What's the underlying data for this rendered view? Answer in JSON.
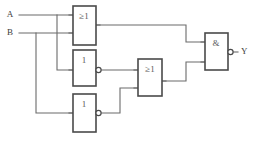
{
  "diagram": {
    "type": "logic-gate-schematic",
    "canvas": {
      "width": 257,
      "height": 141
    },
    "colors": {
      "background": "#ffffff",
      "wire": "#6b6b6b",
      "gate_outline": "#4a4a4a",
      "label_text": "#3d3d3d",
      "gate_label_text": "#5a5a5a"
    }
  },
  "inputs": [
    {
      "id": "A",
      "label": "A",
      "x": 10,
      "y": 15
    },
    {
      "id": "B",
      "label": "B",
      "x": 10,
      "y": 33
    }
  ],
  "outputs": [
    {
      "id": "Y",
      "label": "Y",
      "x": 241,
      "y": 52
    }
  ],
  "gates": [
    {
      "id": "or1",
      "label": "≥1",
      "type": "OR",
      "inverted_output": false,
      "x": 73,
      "y": 6,
      "w": 23,
      "h": 39,
      "label_x": 84,
      "label_y": 17,
      "inputs": [
        {
          "name": "in-a",
          "y": 15
        },
        {
          "name": "in-b",
          "y": 33
        }
      ],
      "output_y": 25
    },
    {
      "id": "inv1",
      "label": "1",
      "type": "NOT",
      "inverted_output": true,
      "x": 73,
      "y": 50,
      "w": 23,
      "h": 36,
      "label_x": 84,
      "label_y": 61,
      "inputs": [
        {
          "name": "in-a",
          "y": 70
        }
      ],
      "output_y": 70,
      "bubble_cx": 98.5,
      "bubble_cy": 70,
      "bubble_r": 2.6
    },
    {
      "id": "inv2",
      "label": "1",
      "type": "NOT",
      "inverted_output": true,
      "x": 73,
      "y": 94,
      "w": 23,
      "h": 38,
      "label_x": 84,
      "label_y": 105,
      "inputs": [
        {
          "name": "in-a",
          "y": 113
        }
      ],
      "output_y": 113,
      "bubble_cx": 98.5,
      "bubble_cy": 113,
      "bubble_r": 2.6
    },
    {
      "id": "or2",
      "label": "≥1",
      "type": "OR",
      "inverted_output": false,
      "x": 138,
      "y": 59,
      "w": 24,
      "h": 37,
      "label_x": 150,
      "label_y": 70,
      "inputs": [
        {
          "name": "in-a",
          "y": 70
        },
        {
          "name": "in-b",
          "y": 88
        }
      ],
      "output_y": 81
    },
    {
      "id": "and1",
      "label": "&",
      "type": "AND",
      "inverted_output": true,
      "x": 205,
      "y": 33,
      "w": 23,
      "h": 37,
      "label_x": 216,
      "label_y": 44,
      "inputs": [
        {
          "name": "in-a",
          "y": 42
        },
        {
          "name": "in-b",
          "y": 62
        }
      ],
      "output_y": 52,
      "bubble_cx": 230.5,
      "bubble_cy": 52,
      "bubble_r": 2.6
    }
  ],
  "wires": [
    {
      "name": "wire-a-to-or1",
      "d": "M 19 15 L 73 15"
    },
    {
      "name": "wire-b-to-or1",
      "d": "M 19 33 L 73 33"
    },
    {
      "name": "wire-a-branch-to-inv1",
      "d": "M 57 15 L 57 70 L 73 70"
    },
    {
      "name": "wire-b-branch-to-inv2",
      "d": "M 36 33 L 36 113 L 73 113"
    },
    {
      "name": "wire-or1-to-and1",
      "d": "M 96 25 L 186 25 L 186 42 L 205 42"
    },
    {
      "name": "wire-inv1-to-or2",
      "d": "M 101 70 L 138 70"
    },
    {
      "name": "wire-inv2-to-or2",
      "d": "M 101 113 L 120 113 L 120 88 L 138 88"
    },
    {
      "name": "wire-or2-to-and1",
      "d": "M 162 81 L 186 81 L 186 62 L 205 62"
    },
    {
      "name": "wire-and1-to-y",
      "d": "M 233 52 L 238 52"
    }
  ]
}
